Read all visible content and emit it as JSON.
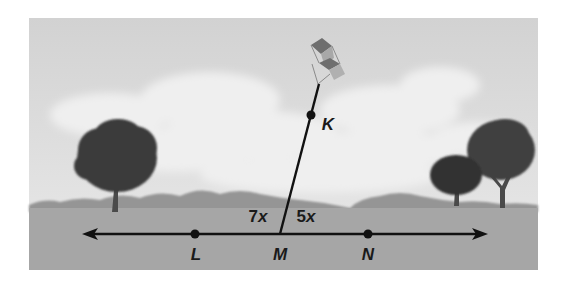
{
  "figure": {
    "colors": {
      "sky": "#d9d9d9",
      "cloud": "#ececec",
      "ground": "#a3a3a3",
      "hills": "#8e8e8e",
      "tree": "#3a3a3a",
      "line": "#111111"
    }
  },
  "points": {
    "L": {
      "label": "L",
      "x": 195,
      "y": 234
    },
    "M": {
      "label": "M",
      "x": 280,
      "y": 234
    },
    "N": {
      "label": "N",
      "x": 368,
      "y": 234
    },
    "K": {
      "label": "K",
      "x": 311,
      "y": 115
    }
  },
  "angles": {
    "left": {
      "coef": "7",
      "var": "x"
    },
    "right": {
      "coef": "5",
      "var": "x"
    }
  },
  "lines": {
    "LN": {
      "name": "line LN",
      "direction": "double-arrow"
    },
    "MK": {
      "name": "ray MK",
      "direction": "toward kite"
    }
  }
}
